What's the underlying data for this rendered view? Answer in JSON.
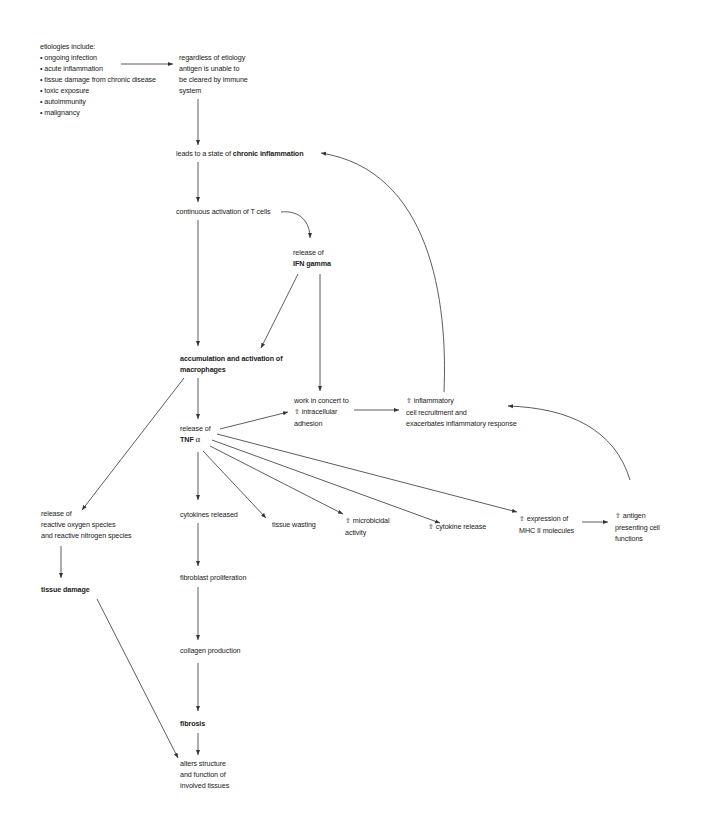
{
  "diagram": {
    "type": "flowchart",
    "nodes": {
      "etiologies": {
        "header": "etiologies include:",
        "items": [
          "• ongoing infection",
          "• acute inflammation",
          "• tissue damage from chronic disease",
          "• toxic exposure",
          "• autoimmunity",
          "• malignancy"
        ]
      },
      "antigen": {
        "lines": [
          "regardless of etiology",
          "antigen is unable to",
          "be cleared by immune",
          "system"
        ]
      },
      "chronic": {
        "prefix": "leads to a state of ",
        "bold": "chronic inflammation"
      },
      "tcells": {
        "text": "continuous activation of T cells"
      },
      "ifn": {
        "line1": "release of",
        "bold": "IFN gamma"
      },
      "macrophages": {
        "line1": "accumulation and activation of",
        "line2": "macrophages"
      },
      "adhesion": {
        "line1": "work in concert to",
        "line2": "intracellular",
        "line3": "adhesion"
      },
      "recruitment": {
        "line1": "inflammatory",
        "line2": "cell recruitment and",
        "line3": "exacerbates inflammatory response"
      },
      "tnf": {
        "line1": "release of",
        "bold": "TNF ",
        "symbol": "α"
      },
      "ros": {
        "lines": [
          "release of",
          "reactive oxygen species",
          "and reactive nitrogen species"
        ]
      },
      "cytokines": {
        "text": "cytokines released"
      },
      "wasting": {
        "text": "tissue wasting"
      },
      "microbicidal": {
        "line1": "microbicidal",
        "line2": "activity"
      },
      "cytokine_release": {
        "text": "cytokine release"
      },
      "mhc": {
        "line1": "expression of",
        "line2": "MHC II molecules"
      },
      "apc": {
        "line1": "antigen",
        "line2": "presenting cell",
        "line3": "functions"
      },
      "tissue_damage": {
        "text": "tissue damage"
      },
      "fibroblast": {
        "text": "fibroblast proliferation"
      },
      "collagen": {
        "text": "collagen production"
      },
      "fibrosis": {
        "text": "fibrosis"
      },
      "alters": {
        "lines": [
          "alters structure",
          "and function of",
          "involved tissues"
        ]
      }
    },
    "icons": {
      "increase": "⇧"
    },
    "edges": [
      [
        "etiologies",
        "antigen"
      ],
      [
        "antigen",
        "chronic"
      ],
      [
        "chronic",
        "tcells"
      ],
      [
        "tcells",
        "ifn"
      ],
      [
        "tcells",
        "macrophages"
      ],
      [
        "ifn",
        "macrophages"
      ],
      [
        "ifn",
        "adhesion"
      ],
      [
        "macrophages",
        "tnf"
      ],
      [
        "macrophages",
        "ros"
      ],
      [
        "tnf",
        "adhesion"
      ],
      [
        "adhesion",
        "recruitment"
      ],
      [
        "recruitment",
        "chronic"
      ],
      [
        "tnf",
        "cytokines"
      ],
      [
        "tnf",
        "wasting"
      ],
      [
        "tnf",
        "microbicidal"
      ],
      [
        "tnf",
        "cytokine_release"
      ],
      [
        "tnf",
        "mhc"
      ],
      [
        "mhc",
        "apc"
      ],
      [
        "apc",
        "recruitment"
      ],
      [
        "ros",
        "tissue_damage"
      ],
      [
        "tissue_damage",
        "alters"
      ],
      [
        "cytokines",
        "fibroblast"
      ],
      [
        "fibroblast",
        "collagen"
      ],
      [
        "collagen",
        "fibrosis"
      ],
      [
        "fibrosis",
        "alters"
      ]
    ]
  }
}
